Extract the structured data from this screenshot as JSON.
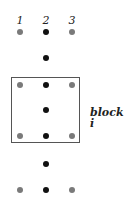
{
  "column_labels": [
    "1",
    "2",
    "3"
  ],
  "block_label": "block i",
  "colors": {
    "gray_dot": "#7a7a7a",
    "black_dot": "#111111",
    "box_border": "#555555"
  },
  "rows": [
    {
      "y": 32,
      "dots": [
        "gray",
        "black",
        "gray"
      ]
    },
    {
      "y": 58,
      "dots": [
        null,
        "black",
        null
      ]
    },
    {
      "y": 85,
      "dots": [
        "gray",
        "black",
        "gray"
      ],
      "in_block": true
    },
    {
      "y": 110,
      "dots": [
        null,
        "black",
        null
      ],
      "in_block": true
    },
    {
      "y": 136,
      "dots": [
        "gray",
        "black",
        "gray"
      ],
      "in_block": true
    },
    {
      "y": 164,
      "dots": [
        null,
        "black",
        null
      ]
    },
    {
      "y": 190,
      "dots": [
        "gray",
        "black",
        "gray"
      ]
    }
  ]
}
